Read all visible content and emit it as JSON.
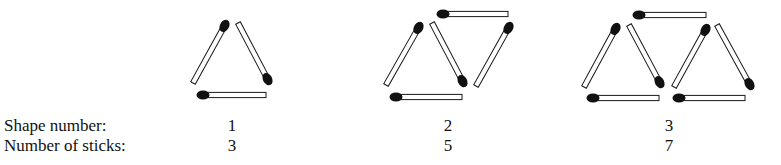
{
  "labels": {
    "shape_number": "Shape number:",
    "number_of_sticks": "Number of sticks:"
  },
  "shapes": [
    {
      "shape_number": "1",
      "sticks": "3"
    },
    {
      "shape_number": "2",
      "sticks": "5"
    },
    {
      "shape_number": "3",
      "sticks": "7"
    }
  ],
  "colors": {
    "stick_fill": "#ffffff",
    "stick_outline": "#1a1a1a",
    "match_head": "#111111",
    "text": "#111111"
  },
  "matchsticks": [
    {
      "shape": 1,
      "head": [
        225,
        25
      ],
      "tail": [
        193,
        83
      ]
    },
    {
      "shape": 1,
      "head": [
        268,
        80
      ],
      "tail": [
        238,
        23
      ]
    },
    {
      "shape": 1,
      "head": [
        202,
        95
      ],
      "tail": [
        266,
        95
      ]
    },
    {
      "shape": 2,
      "head": [
        442,
        14
      ],
      "tail": [
        508,
        14
      ]
    },
    {
      "shape": 2,
      "head": [
        419,
        27
      ],
      "tail": [
        386,
        85
      ]
    },
    {
      "shape": 2,
      "head": [
        463,
        82
      ],
      "tail": [
        432,
        23
      ]
    },
    {
      "shape": 2,
      "head": [
        509,
        27
      ],
      "tail": [
        476,
        86
      ]
    },
    {
      "shape": 2,
      "head": [
        395,
        97
      ],
      "tail": [
        462,
        97
      ]
    },
    {
      "shape": 3,
      "head": [
        638,
        15
      ],
      "tail": [
        706,
        15
      ]
    },
    {
      "shape": 3,
      "head": [
        616,
        28
      ],
      "tail": [
        584,
        87
      ]
    },
    {
      "shape": 3,
      "head": [
        660,
        83
      ],
      "tail": [
        629,
        25
      ]
    },
    {
      "shape": 3,
      "head": [
        706,
        29
      ],
      "tail": [
        674,
        87
      ]
    },
    {
      "shape": 3,
      "head": [
        750,
        85
      ],
      "tail": [
        717,
        25
      ]
    },
    {
      "shape": 3,
      "head": [
        592,
        98
      ],
      "tail": [
        659,
        98
      ]
    },
    {
      "shape": 3,
      "head": [
        678,
        98
      ],
      "tail": [
        745,
        98
      ]
    }
  ]
}
